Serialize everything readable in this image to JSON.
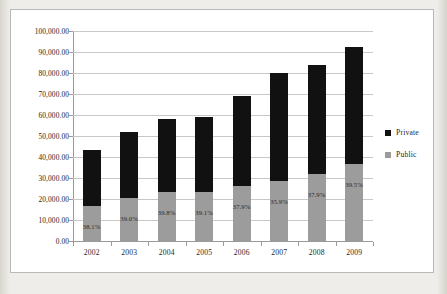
{
  "chart_data": {
    "type": "bar",
    "subtype": "stacked-column",
    "title": "",
    "subtitle": "",
    "xlabel": "",
    "ylabel": "",
    "categories": [
      "2002",
      "2003",
      "2004",
      "2005",
      "2006",
      "2007",
      "2008",
      "2009"
    ],
    "series": [
      {
        "name": "Public",
        "color": "#9c9c9c",
        "values": [
          16500,
          20300,
          23100,
          23100,
          26100,
          28700,
          31700,
          36500
        ]
      },
      {
        "name": "Private",
        "color": "#111111",
        "values": [
          27000,
          31700,
          34900,
          35900,
          42900,
          51300,
          52000,
          55900
        ]
      }
    ],
    "totals": [
      43500,
      52000,
      58000,
      59000,
      69000,
      80000,
      83700,
      92400
    ],
    "data_labels": [
      "38.1%",
      "39.0%",
      "39.8%",
      "39.1%",
      "37.9%",
      "35.9%",
      "37.9%",
      "39.5%"
    ],
    "data_label_note": "Public share of total, printed inside the Public segment of each column",
    "ylim": [
      0,
      100000
    ],
    "ytick_step": 10000,
    "ytick_labels": [
      "100,000.00",
      "90,000.00",
      "80,000.00",
      "70,000.00",
      "60,000.00",
      "50,000.00",
      "40,000.00",
      "30,000.00",
      "20,000.00",
      "10,000.00",
      "0.00"
    ],
    "grid": true,
    "grid_axis": "y",
    "legend_position": "right",
    "legend": [
      "Private",
      "Public"
    ]
  },
  "legend": {
    "items": [
      {
        "label": "Private",
        "color": "#111111"
      },
      {
        "label": "Public",
        "color": "#9c9c9c"
      }
    ]
  },
  "colors": {
    "private": "#111111",
    "public": "#9c9c9c",
    "grid": "#c8c8c8",
    "axis": "#9a9a9a",
    "plot_background": "#ffffff",
    "page_background": "#eceae5"
  }
}
